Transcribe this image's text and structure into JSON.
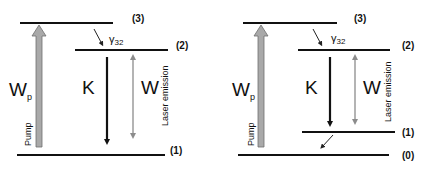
{
  "diagrams": [
    {
      "name": "three-level-laser",
      "levels": [
        {
          "label": "(3)"
        },
        {
          "label": "(2)"
        },
        {
          "label": "(1)"
        }
      ],
      "pump_rate_label": "W",
      "pump_rate_subscript": "p",
      "pump_label": "Pump",
      "decay_label": "γ",
      "decay_subscript": "32",
      "spontaneous_label": "K",
      "stimulated_label": "W",
      "emission_label": "Laser emission"
    },
    {
      "name": "four-level-laser",
      "levels": [
        {
          "label": "(3)"
        },
        {
          "label": "(2)"
        },
        {
          "label": "(1)"
        },
        {
          "label": "(0)"
        }
      ],
      "pump_rate_label": "W",
      "pump_rate_subscript": "p",
      "pump_label": "Pump",
      "decay_label": "γ",
      "decay_subscript": "32",
      "spontaneous_label": "K",
      "stimulated_label": "W",
      "emission_label": "Laser emission"
    }
  ],
  "colors": {
    "level_line": "#111111",
    "pump_arrow": "#a9a9a9",
    "pump_arrow_stroke": "#6e6e6e",
    "k_arrow": "#111111",
    "w_arrow": "#8c8c8c"
  }
}
